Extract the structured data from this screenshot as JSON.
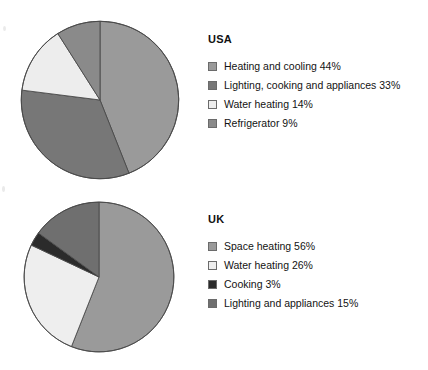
{
  "chart_data": [
    {
      "type": "pie",
      "title": "USA",
      "categories": [
        "Heating and cooling",
        "Lighting, cooking and appliances",
        "Water heating",
        "Refrigerator"
      ],
      "values": [
        44,
        33,
        14,
        9
      ],
      "value_unit": "%",
      "labels": [
        "Heating and cooling 44%",
        "Lighting, cooking and appliances 33%",
        "Water heating 14%",
        "Refrigerator 9%"
      ],
      "colors": [
        "#9a9a9a",
        "#777777",
        "#ededed",
        "#8a8a8a"
      ],
      "start_angle_deg": 0,
      "direction": "clockwise",
      "legend_position": "right",
      "grid": false,
      "xlabel": "",
      "ylabel": ""
    },
    {
      "type": "pie",
      "title": "UK",
      "categories": [
        "Space heating",
        "Water heating",
        "Cooking",
        "Lighting and appliances"
      ],
      "values": [
        56,
        26,
        3,
        15
      ],
      "value_unit": "%",
      "labels": [
        "Space heating 56%",
        "Water heating 26%",
        "Cooking 3%",
        "Lighting and appliances 15%"
      ],
      "colors": [
        "#9a9a9a",
        "#eeeeee",
        "#2b2b2b",
        "#6f6f6f"
      ],
      "start_angle_deg": 0,
      "direction": "clockwise",
      "legend_position": "right",
      "grid": false,
      "xlabel": "",
      "ylabel": ""
    }
  ],
  "usa": {
    "legend_title": "USA",
    "items": [
      {
        "label": "Heating and cooling 44%",
        "color": "#9a9a9a"
      },
      {
        "label": "Lighting, cooking and appliances 33%",
        "color": "#777777"
      },
      {
        "label": "Water heating 14%",
        "color": "#ededed"
      },
      {
        "label": "Refrigerator 9%",
        "color": "#8a8a8a"
      }
    ]
  },
  "uk": {
    "legend_title": "UK",
    "items": [
      {
        "label": "Space heating 56%",
        "color": "#9a9a9a"
      },
      {
        "label": "Water heating 26%",
        "color": "#eeeeee"
      },
      {
        "label": "Cooking 3%",
        "color": "#2b2b2b"
      },
      {
        "label": "Lighting and appliances 15%",
        "color": "#6f6f6f"
      }
    ]
  },
  "style": {
    "slice_stroke": "#4a4a4a",
    "page_background": "#ffffff"
  }
}
